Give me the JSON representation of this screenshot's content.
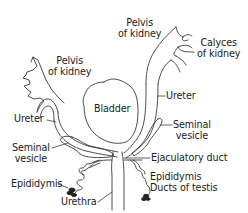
{
  "diagram": {
    "type": "anatomical-line-drawing",
    "line_color": "#3a3a3a",
    "text_color": "#1a1a1a",
    "background": "#ffffff",
    "labels": {
      "pelvis_left_1": "Pelvis",
      "pelvis_left_2": "of kidney",
      "pelvis_right_1": "Pelvis",
      "pelvis_right_2": "of kidney",
      "calyces_1": "Calyces",
      "calyces_2": "of kidney",
      "bladder": "Bladder",
      "ureter_left": "Ureter",
      "ureter_right": "Ureter",
      "seminal_left_1": "Seminal",
      "seminal_left_2": "vesicle",
      "seminal_right_1": "Seminal",
      "seminal_right_2": "vesicle",
      "ejaculatory_duct": "Ejaculatory duct",
      "epididymis_left": "Epididymis",
      "epididymis_right": "Epididymis",
      "ducts_of_testis": "Ducts of testis",
      "urethra": "Urethra"
    }
  }
}
